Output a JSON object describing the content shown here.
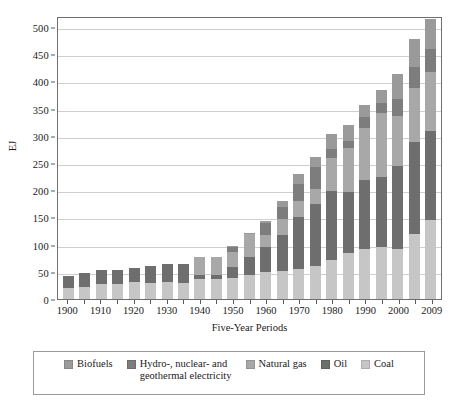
{
  "chart_data": {
    "type": "bar",
    "stacked": true,
    "title": "",
    "xlabel": "Five-Year Periods",
    "ylabel": "EJ",
    "ylim": [
      0,
      520
    ],
    "yticks": [
      0,
      50,
      100,
      150,
      200,
      250,
      300,
      350,
      400,
      450,
      500
    ],
    "grid": true,
    "legend_position": "bottom",
    "categories": [
      "1900",
      "1905",
      "1910",
      "1915",
      "1920",
      "1925",
      "1930",
      "1935",
      "1940",
      "1945",
      "1950",
      "1955",
      "1960",
      "1965",
      "1970",
      "1975",
      "1980",
      "1985",
      "1990",
      "1995",
      "2000",
      "2005",
      "2009"
    ],
    "xtick_labels": [
      "1900",
      "1910",
      "1920",
      "1930",
      "1940",
      "1950",
      "1960",
      "1970",
      "1980",
      "1990",
      "2000",
      "2009"
    ],
    "series": [
      {
        "name": "Coal",
        "color": "#c6c6c6",
        "values": [
          20,
          22,
          28,
          27,
          31,
          30,
          31,
          30,
          37,
          36,
          38,
          44,
          49,
          51,
          56,
          61,
          72,
          84,
          91,
          95,
          92,
          120,
          146
        ]
      },
      {
        "name": "Oil",
        "color": "#6e6e6e",
        "values": [
          23,
          25,
          25,
          26,
          26,
          30,
          33,
          34,
          8,
          8,
          20,
          33,
          46,
          66,
          95,
          114,
          127,
          113,
          127,
          130,
          153,
          169,
          163
        ]
      },
      {
        "name": "Natural gas",
        "color": "#a8a8a8",
        "values": [
          0,
          0,
          0,
          0,
          0,
          0,
          0,
          0,
          32,
          33,
          29,
          42,
          22,
          30,
          30,
          28,
          61,
          81,
          96,
          117,
          91,
          99,
          109
        ]
      },
      {
        "name": "Hydro-, nuclear- and geothermal electricity",
        "color": "#7d7d7d",
        "values": [
          0,
          0,
          0,
          0,
          0,
          0,
          0,
          0,
          0,
          0,
          8,
          1,
          22,
          23,
          31,
          39,
          16,
          12,
          20,
          19,
          32,
          38,
          41
        ]
      },
      {
        "name": "Biofuels",
        "color": "#9a9a9a",
        "values": [
          0,
          0,
          0,
          0,
          0,
          0,
          0,
          0,
          0,
          0,
          3,
          1,
          4,
          10,
          18,
          19,
          27,
          30,
          23,
          24,
          46,
          51,
          56
        ]
      }
    ],
    "totals": [
      43,
      47,
      53,
      53,
      57,
      60,
      64,
      64,
      77,
      77,
      98,
      121,
      143,
      180,
      230,
      261,
      303,
      320,
      357,
      385,
      414,
      477,
      515
    ]
  },
  "legend": {
    "items": [
      {
        "label": "Biofuels",
        "color": "#9a9a9a"
      },
      {
        "label": "Hydro-, nuclear- and\ngeothermal electricity",
        "color": "#7d7d7d"
      },
      {
        "label": "Natural gas",
        "color": "#a8a8a8"
      },
      {
        "label": "Oil",
        "color": "#6e6e6e"
      },
      {
        "label": "Coal",
        "color": "#c6c6c6"
      }
    ]
  },
  "axes": {
    "y_title": "EJ",
    "x_title": "Five-Year Periods"
  }
}
